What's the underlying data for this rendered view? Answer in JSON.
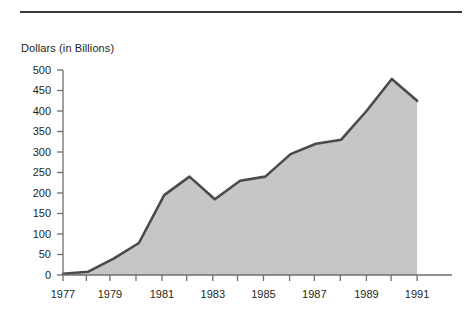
{
  "chart_data": {
    "type": "area",
    "title": "",
    "ylabel": "Dollars (in Billions)",
    "xlabel": "",
    "ylim": [
      0,
      500
    ],
    "xlim": [
      1977,
      1991
    ],
    "grid": false,
    "legend": "none",
    "y_ticks": [
      0,
      50,
      100,
      150,
      200,
      250,
      300,
      350,
      400,
      450,
      500
    ],
    "x_ticks": [
      1977,
      1978,
      1979,
      1980,
      1981,
      1982,
      1983,
      1984,
      1985,
      1986,
      1987,
      1988,
      1989,
      1990,
      1991
    ],
    "x_tick_labels": [
      "1977",
      "",
      "1979",
      "",
      "1981",
      "",
      "1983",
      "",
      "1985",
      "",
      "1987",
      "",
      "1989",
      "",
      "1991"
    ],
    "x_labeled_ticks": [
      "1977",
      "1979",
      "1981",
      "1983",
      "1985",
      "1987",
      "1989",
      "1991"
    ],
    "categories": [
      1977,
      1978,
      1979,
      1980,
      1981,
      1982,
      1983,
      1984,
      1985,
      1986,
      1987,
      1988,
      1989,
      1990,
      1991
    ],
    "values": [
      3,
      8,
      40,
      78,
      195,
      240,
      185,
      230,
      240,
      295,
      320,
      330,
      400,
      478,
      425
    ],
    "series": [
      {
        "name": "Dollars (in Billions)",
        "values": [
          3,
          8,
          40,
          78,
          195,
          240,
          185,
          230,
          240,
          295,
          320,
          330,
          400,
          478,
          425
        ]
      }
    ],
    "colors": {
      "area_fill": "#c6c6c6",
      "line": "#4a4a4a",
      "axis": "#6e6e6e",
      "text": "#231f20",
      "rule": "#3a3a3a"
    }
  }
}
